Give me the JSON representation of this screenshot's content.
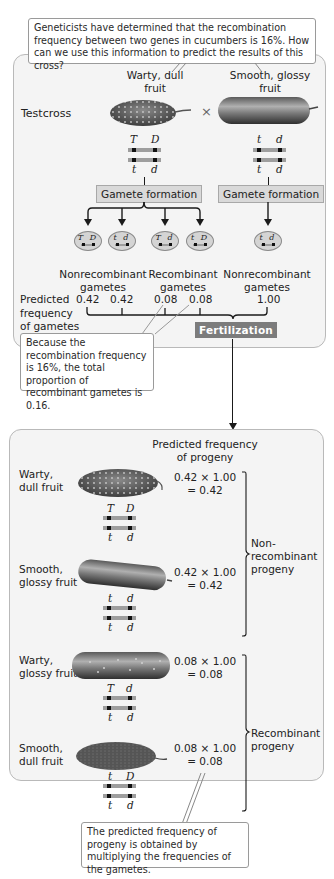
{
  "question_callout": "Geneticists have determined that the recombination frequency between two genes in cucumbers is 16%.  How can we use this information to predict the results of this cross?",
  "cross": {
    "label": "Testcross",
    "parent1": {
      "label_line1": "Warty, dull",
      "label_line2": "fruit",
      "top_alleles": [
        "T",
        "D"
      ],
      "bottom_alleles": [
        "t",
        "d"
      ]
    },
    "parent2": {
      "label_line1": "Smooth, glossy",
      "label_line2": "fruit",
      "top_alleles": [
        "t",
        "d"
      ],
      "bottom_alleles": [
        "t",
        "d"
      ]
    },
    "cross_symbol": "×"
  },
  "gamete_formation_label": "Gamete formation",
  "gametes": {
    "parent1": [
      {
        "alleles": "T D",
        "type": "nonrecombinant",
        "frequency": "0.42"
      },
      {
        "alleles": "t d",
        "type": "nonrecombinant",
        "frequency": "0.42"
      },
      {
        "alleles": "T d",
        "type": "recombinant",
        "frequency": "0.08"
      },
      {
        "alleles": "t D",
        "type": "recombinant",
        "frequency": "0.08"
      }
    ],
    "parent2": [
      {
        "alleles": "t d",
        "type": "nonrecombinant",
        "frequency": "1.00"
      }
    ],
    "group_labels": {
      "nonrecombinant_1": "Nonrecombinant",
      "nonrecombinant_2": "gametes",
      "recombinant_1": "Recombinant",
      "recombinant_2": "gametes",
      "parent2_1": "Nonrecombinant",
      "parent2_2": "gametes"
    }
  },
  "predicted_frequency_label": {
    "line1": "Predicted",
    "line2": "frequency",
    "line3": "of gametes"
  },
  "fertilization_label": "Fertilization",
  "recombination_callout": "Because the recombination frequency is 16%, the total proportion of recombinant gametes is 0.16.",
  "progeny": {
    "header_line1": "Predicted frequency",
    "header_line2": "of progeny",
    "items": [
      {
        "phenotype_line1": "Warty,",
        "phenotype_line2": "dull fruit",
        "top_alleles": [
          "T",
          "D"
        ],
        "bottom_alleles": [
          "t",
          "d"
        ],
        "calc": "0.42 × 1.00",
        "result": "= 0.42"
      },
      {
        "phenotype_line1": "Smooth,",
        "phenotype_line2": "glossy fruit",
        "top_alleles": [
          "t",
          "d"
        ],
        "bottom_alleles": [
          "t",
          "d"
        ],
        "calc": "0.42 × 1.00",
        "result": "= 0.42"
      },
      {
        "phenotype_line1": "Warty,",
        "phenotype_line2": "glossy fruit",
        "top_alleles": [
          "T",
          "d"
        ],
        "bottom_alleles": [
          "t",
          "d"
        ],
        "calc": "0.08 × 1.00",
        "result": "= 0.08"
      },
      {
        "phenotype_line1": "Smooth,",
        "phenotype_line2": "dull fruit",
        "top_alleles": [
          "t",
          "D"
        ],
        "bottom_alleles": [
          "t",
          "d"
        ],
        "calc": "0.08 × 1.00",
        "result": "= 0.08"
      }
    ],
    "nonrecombinant_label": {
      "line1": "Non-",
      "line2": "recombinant",
      "line3": "progeny"
    },
    "recombinant_label": {
      "line1": "Recombinant",
      "line2": "progeny"
    }
  },
  "multiplication_callout": "The predicted frequency of progeny is obtained by multiplying the frequencies of the gametes.",
  "colors": {
    "panel_bg": "#f4f4f4",
    "panel_border": "#b9b9b9",
    "gamete_box_bg": "#d9d9d9",
    "fertilization_bg": "#7c7c7c",
    "chromosome": "#9e9e9e"
  }
}
